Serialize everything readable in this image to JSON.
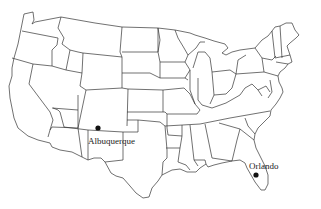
{
  "map": {
    "type": "outline-map",
    "region": "Contiguous United States",
    "style": {
      "stroke": "#333333",
      "background": "#ffffff",
      "dot": "#111111"
    },
    "cities": [
      {
        "name": "Albuquerque",
        "dot_x": 98,
        "dot_y": 128,
        "label_x": 88,
        "label_y": 144
      },
      {
        "name": "Orlando",
        "dot_x": 256,
        "dot_y": 175,
        "label_x": 249,
        "label_y": 169
      }
    ]
  }
}
